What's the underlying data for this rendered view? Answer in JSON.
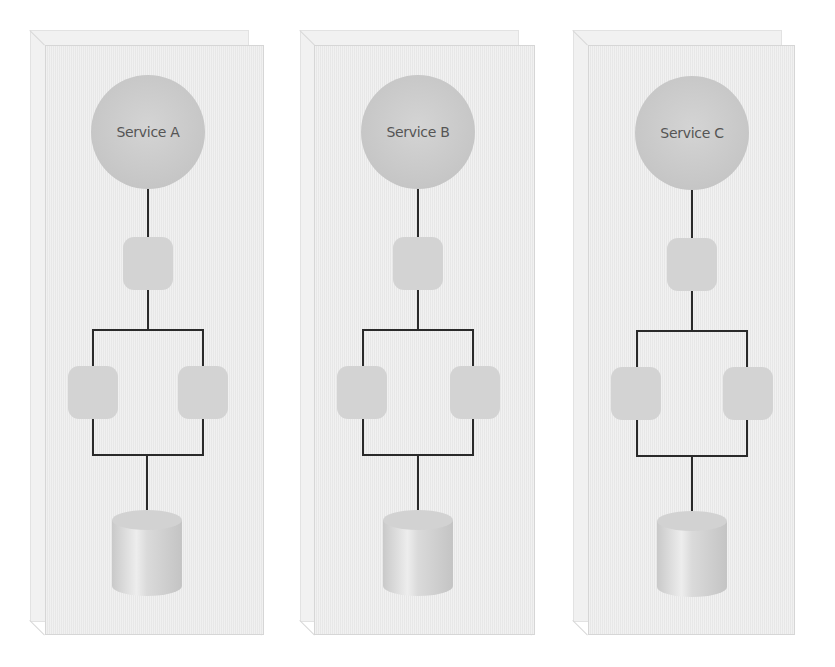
{
  "diagram": {
    "title": "",
    "colors": {
      "panel_fill": "#ececec",
      "service_circle": "#c9c9c9",
      "node_fill": "#d3d3d3",
      "connector": "#2a2a2a",
      "database": "#d0d0d0"
    },
    "panels": [
      {
        "service_label": "Service A",
        "nodes": [
          "front-node",
          "left-node",
          "right-node"
        ],
        "database": "database"
      },
      {
        "service_label": "Service B",
        "nodes": [
          "front-node",
          "left-node",
          "right-node"
        ],
        "database": "database"
      },
      {
        "service_label": "Service C",
        "nodes": [
          "front-node",
          "left-node",
          "right-node"
        ],
        "database": "database"
      }
    ]
  }
}
